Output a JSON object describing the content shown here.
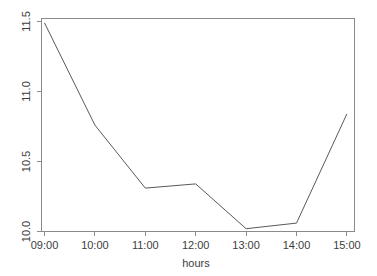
{
  "chart_data": {
    "type": "line",
    "title": "",
    "subtitle": "",
    "xlabel": "hours",
    "ylabel": "",
    "grid": false,
    "legend": false,
    "categories": [
      "09:00",
      "10:00",
      "11:00",
      "12:00",
      "13:00",
      "14:00",
      "15:00"
    ],
    "x": [
      "09:00",
      "10:00",
      "11:00",
      "12:00",
      "13:00",
      "14:00",
      "15:00"
    ],
    "values": [
      11.49,
      10.76,
      10.31,
      10.34,
      10.02,
      10.06,
      10.84
    ],
    "series": [
      {
        "name": "",
        "values": [
          11.49,
          10.76,
          10.31,
          10.34,
          10.02,
          10.06,
          10.84
        ]
      }
    ],
    "xtick_labels": [
      "09:00",
      "10:00",
      "11:00",
      "12:00",
      "13:00",
      "14:00",
      "15:00"
    ],
    "ytick_labels": [
      "10.0",
      "10.5",
      "11.0",
      "11.5"
    ],
    "ytick_values": [
      10.0,
      10.5,
      11.0,
      11.5
    ],
    "ylim": [
      9.99,
      11.52
    ],
    "xlim": [
      0,
      6
    ],
    "line_color": "#595959",
    "axis_color": "#8a8a8a",
    "background_color": "#ffffff"
  },
  "labels": {
    "y_11_5": "11.5",
    "y_11_0": "11.0",
    "y_10_5": "10.5",
    "y_10_0": "10.0",
    "x_0900": "09:00",
    "x_1000": "10:00",
    "x_1100": "11:00",
    "x_1200": "12:00",
    "x_1300": "13:00",
    "x_1400": "14:00",
    "x_1500": "15:00",
    "xaxis_title": "hours"
  }
}
